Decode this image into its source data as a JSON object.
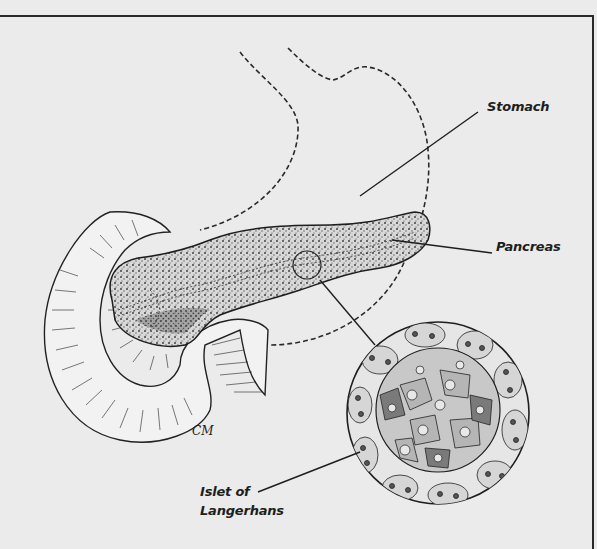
{
  "figure": {
    "type": "anatomical illustration",
    "background_color": "#ebebeb",
    "ink_color": "#1e1e1e",
    "signature": "CM"
  },
  "labels": {
    "stomach": "Stomach",
    "pancreas": "Pancreas",
    "islet_line1": "Islet of",
    "islet_line2": "Langerhans"
  },
  "structures": [
    {
      "name": "Stomach",
      "style": "dashed outline"
    },
    {
      "name": "Pancreas",
      "style": "stippled organ with duct"
    },
    {
      "name": "Duodenum",
      "style": "hatched curved tube"
    },
    {
      "name": "Islet of Langerhans",
      "style": "magnified circular cell inset"
    }
  ]
}
